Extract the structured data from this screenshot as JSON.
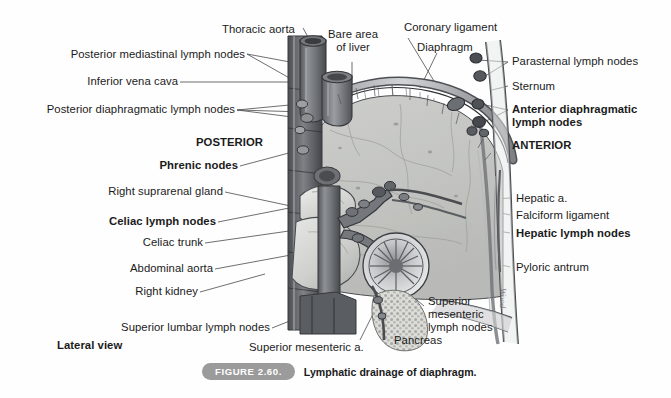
{
  "figure": {
    "title": "Lymphatic drainage of diaphragm",
    "number": "FIGURE 2.60.",
    "caption": "Lymphatic drainage of diaphragm.",
    "view_note": "Lateral view",
    "artist_signature": "Wood",
    "background_color": "#fefefe",
    "ink_color": "#1b1b1b",
    "pill_color": "#9b9b9b"
  },
  "orientation": {
    "posterior": "POSTERIOR",
    "anterior": "ANTERIOR"
  },
  "labels_left": [
    {
      "id": "thoracic-aorta",
      "text": "Thoracic aorta",
      "bold": false
    },
    {
      "id": "posterior-mediastinal-lymph-nodes",
      "text": "Posterior mediastinal lymph nodes",
      "bold": false
    },
    {
      "id": "inferior-vena-cava",
      "text": "Inferior vena cava",
      "bold": false
    },
    {
      "id": "posterior-diaphragmatic-lymph-nodes",
      "text": "Posterior diaphragmatic lymph nodes",
      "bold": false
    },
    {
      "id": "phrenic-nodes",
      "text": "Phrenic nodes",
      "bold": true
    },
    {
      "id": "right-suprarenal-gland",
      "text": "Right suprarenal gland",
      "bold": false
    },
    {
      "id": "celiac-lymph-nodes",
      "text": "Celiac lymph nodes",
      "bold": true
    },
    {
      "id": "celiac-trunk",
      "text": "Celiac trunk",
      "bold": false
    },
    {
      "id": "abdominal-aorta",
      "text": "Abdominal aorta",
      "bold": false
    },
    {
      "id": "right-kidney",
      "text": "Right kidney",
      "bold": false
    },
    {
      "id": "superior-lumbar-lymph-nodes",
      "text": "Superior lumbar lymph nodes",
      "bold": false
    },
    {
      "id": "superior-mesenteric-artery",
      "text": "Superior mesenteric a.",
      "bold": false
    }
  ],
  "labels_top": [
    {
      "id": "bare-area-of-liver",
      "line1": "Bare area",
      "line2": "of liver"
    },
    {
      "id": "coronary-ligament",
      "text": "Coronary ligament"
    },
    {
      "id": "diaphragm",
      "text": "Diaphragm"
    }
  ],
  "labels_right": [
    {
      "id": "parasternal-lymph-nodes",
      "text": "Parasternal lymph nodes",
      "bold": false
    },
    {
      "id": "sternum",
      "text": "Sternum",
      "bold": false
    },
    {
      "id": "anterior-diaphragmatic-lymph-nodes",
      "line1": "Anterior diaphragmatic",
      "line2": "lymph nodes",
      "bold": true
    },
    {
      "id": "hepatic-artery",
      "text": "Hepatic a.",
      "bold": false
    },
    {
      "id": "falciform-ligament",
      "text": "Falciform ligament",
      "bold": false
    },
    {
      "id": "hepatic-lymph-nodes",
      "text": "Hepatic lymph nodes",
      "bold": true
    },
    {
      "id": "pyloric-antrum",
      "text": "Pyloric antrum",
      "bold": false
    }
  ],
  "labels_bottom": [
    {
      "id": "superior-mesenteric-lymph-nodes",
      "line1": "Superior",
      "line2": "mesenteric",
      "line3": "lymph nodes"
    },
    {
      "id": "pancreas",
      "text": "Pancreas"
    }
  ]
}
